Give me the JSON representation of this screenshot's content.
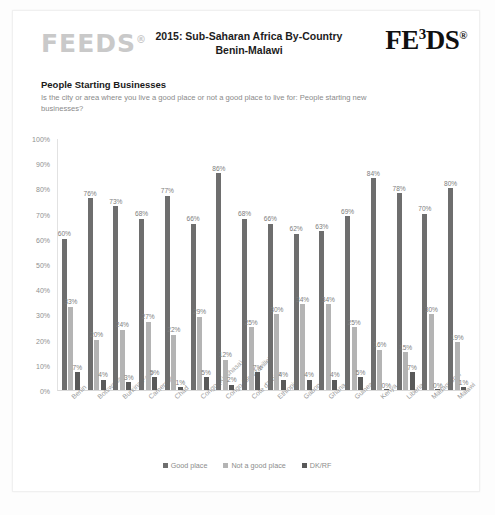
{
  "header": {
    "logo_left": "FEEDS",
    "logo_left_reg": "®",
    "title_line1": "2015: Sub-Saharan Africa By-Country",
    "title_line2": "Benin-Malawi",
    "logo_right_a": "FE",
    "logo_right_sup": "3",
    "logo_right_b": "DS",
    "logo_right_reg": "®"
  },
  "question": {
    "heading": "People Starting Businesses",
    "text": "Is the city or area where you live a good place or not a good place to live for: People starting new businesses?"
  },
  "legend": {
    "items": [
      {
        "label": "Good place",
        "color": "#6e6e6e"
      },
      {
        "label": "Not a good place",
        "color": "#b4b4b4"
      },
      {
        "label": "DK/RF",
        "color": "#595959"
      }
    ]
  },
  "chart_data": {
    "type": "bar",
    "title": "2015: Sub-Saharan Africa By-Country Benin-Malawi",
    "subtitle": "People Starting Businesses",
    "xlabel": "",
    "ylabel": "",
    "ylim": [
      0,
      100
    ],
    "yticks": [
      "0%",
      "10%",
      "20%",
      "30%",
      "40%",
      "50%",
      "60%",
      "70%",
      "80%",
      "90%",
      "100%"
    ],
    "ytick_values": [
      0,
      10,
      20,
      30,
      40,
      50,
      60,
      70,
      80,
      90,
      100
    ],
    "grid": false,
    "legend_position": "bottom",
    "value_suffix": "%",
    "categories": [
      "Benin",
      "Botswana",
      "Burkina Faso",
      "Cameroon",
      "Chad",
      "Congo (Kinshasa)",
      "Congo (Brazzaville)",
      "Cote d'Ivoire",
      "Ethiopia",
      "Gabon",
      "Ghana",
      "Guinea",
      "Kenya",
      "Liberia",
      "Madagascar",
      "Malawi"
    ],
    "series": [
      {
        "name": "Good place",
        "color": "#6e6e6e",
        "values": [
          60,
          76,
          73,
          68,
          77,
          66,
          86,
          68,
          66,
          62,
          63,
          69,
          84,
          78,
          70,
          80
        ]
      },
      {
        "name": "Not a good place",
        "color": "#b4b4b4",
        "values": [
          33,
          20,
          24,
          27,
          22,
          29,
          12,
          25,
          30,
          34,
          34,
          25,
          16,
          15,
          30,
          19
        ]
      },
      {
        "name": "DK/RF",
        "color": "#595959",
        "values": [
          7,
          4,
          3,
          5,
          1,
          5,
          2,
          7,
          4,
          4,
          4,
          5,
          0,
          7,
          0,
          1
        ]
      }
    ]
  }
}
